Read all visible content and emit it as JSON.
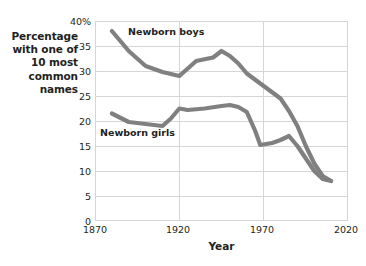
{
  "chart_data": {
    "type": "line",
    "title": "",
    "xlabel": "Year",
    "ylabel": "Percentage with one of 10 most common names",
    "xlim": [
      1870,
      2020
    ],
    "ylim": [
      0,
      40
    ],
    "grid": true,
    "legend_position": "inline-annotations",
    "x_ticks": [
      "1870",
      "1920",
      "1970",
      "2020"
    ],
    "x_tick_values": [
      1870,
      1920,
      1970,
      2020
    ],
    "y_ticks": [
      "0",
      "5",
      "10",
      "15",
      "20",
      "25",
      "30",
      "35",
      "40%"
    ],
    "y_tick_values": [
      0,
      5,
      10,
      15,
      20,
      25,
      30,
      35,
      40
    ],
    "series": [
      {
        "name": "Newborn boys",
        "color": "#808080",
        "x": [
          1880,
          1890,
          1900,
          1910,
          1920,
          1925,
          1930,
          1940,
          1945,
          1950,
          1955,
          1960,
          1970,
          1980,
          1985,
          1990,
          1995,
          2000,
          2005,
          2010
        ],
        "values": [
          38.0,
          34.0,
          31.0,
          29.8,
          29.0,
          30.5,
          32.0,
          32.7,
          34.0,
          33.0,
          31.5,
          29.5,
          27.0,
          24.5,
          22.0,
          19.0,
          15.0,
          11.5,
          9.0,
          8.0
        ]
      },
      {
        "name": "Newborn girls",
        "color": "#808080",
        "x": [
          1880,
          1890,
          1900,
          1910,
          1915,
          1920,
          1925,
          1935,
          1945,
          1950,
          1955,
          1960,
          1965,
          1968,
          1975,
          1980,
          1985,
          1990,
          1995,
          2000,
          2005,
          2010
        ],
        "values": [
          21.5,
          19.8,
          19.4,
          19.0,
          20.5,
          22.5,
          22.2,
          22.5,
          23.0,
          23.2,
          22.8,
          21.8,
          18.0,
          15.2,
          15.6,
          16.2,
          17.0,
          15.0,
          12.5,
          10.0,
          8.4,
          8.0
        ]
      }
    ],
    "annotations": [
      {
        "text": "Newborn boys",
        "x": 1898,
        "y": 37.5
      },
      {
        "text": "Newborn girls",
        "x": 1873,
        "y": 17.0
      }
    ]
  },
  "axes": {
    "y_title_lines": [
      "Percentage",
      "with one of",
      "10 most",
      "common",
      "names"
    ],
    "x_title": "Year"
  },
  "colors": {
    "line": "#808080",
    "grid": "#d6d6d6",
    "text": "#231f20",
    "background": "#ffffff"
  }
}
